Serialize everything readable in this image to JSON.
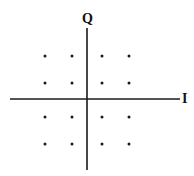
{
  "diagram": {
    "type": "constellation",
    "axes": {
      "horizontal_label": "I",
      "vertical_label": "Q",
      "color": "#1a1a1a"
    },
    "points_color": "#1a1a1a",
    "grid": {
      "columns": [
        -3,
        -1,
        1,
        3
      ],
      "rows": [
        3,
        1,
        -1,
        -3
      ]
    },
    "points": [
      {
        "i": -3,
        "q": 3
      },
      {
        "i": -1,
        "q": 3
      },
      {
        "i": 1,
        "q": 3
      },
      {
        "i": 3,
        "q": 3
      },
      {
        "i": -3,
        "q": 1
      },
      {
        "i": -1,
        "q": 1
      },
      {
        "i": 1,
        "q": 1
      },
      {
        "i": 3,
        "q": 1
      },
      {
        "i": -3,
        "q": -1
      },
      {
        "i": -1,
        "q": -1
      },
      {
        "i": 1,
        "q": -1
      },
      {
        "i": 3,
        "q": -1
      },
      {
        "i": -3,
        "q": -3
      },
      {
        "i": -1,
        "q": -3
      },
      {
        "i": 1,
        "q": -3
      },
      {
        "i": 3,
        "q": -3
      }
    ]
  }
}
